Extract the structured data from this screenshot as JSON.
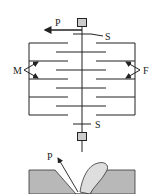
{
  "diagram": {
    "top_figure": {
      "labels": {
        "pull": "P",
        "spring_top": "S",
        "spring_bottom": "S",
        "matrix": "M",
        "fiber": "F"
      },
      "colors": {
        "line": "#222222",
        "block_fill": "#cccccc"
      }
    },
    "bottom_figure": {
      "labels": {
        "pull": "P"
      },
      "colors": {
        "substrate": "#b8b8b8",
        "peel_fill": "#dedede",
        "line": "#333333"
      }
    }
  }
}
